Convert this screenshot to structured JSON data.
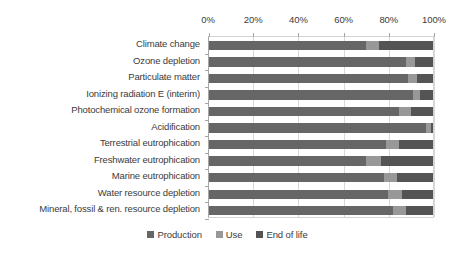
{
  "chart_data": {
    "type": "bar",
    "orientation": "horizontal",
    "stacked": true,
    "normalized_percent": true,
    "title": "",
    "subtitle": "",
    "xlabel": "",
    "ylabel": "",
    "xlim": [
      0,
      100
    ],
    "grid": true,
    "legend_position": "bottom",
    "xticks": [
      0,
      20,
      40,
      60,
      80,
      100
    ],
    "xtick_labels": [
      "0%",
      "20%",
      "40%",
      "60%",
      "80%",
      "100%"
    ],
    "categories": [
      "Climate change",
      "Ozone depletion",
      "Particulate matter",
      "Ionizing radiation E (interim)",
      "Photochemical ozone formation",
      "Acidification",
      "Terrestrial eutrophication",
      "Freshwater eutrophication",
      "Marine eutrophication",
      "Water resource depletion",
      "Mineral, fossil & ren. resource depletion"
    ],
    "series": [
      {
        "name": "Production",
        "color": "#666666",
        "values": [
          70,
          88,
          89,
          91,
          85,
          97,
          79,
          70,
          78,
          80,
          82
        ]
      },
      {
        "name": "Use",
        "color": "#989898",
        "values": [
          6,
          4,
          4,
          3,
          5,
          2,
          6,
          7,
          6,
          6,
          6
        ]
      },
      {
        "name": "End of life",
        "color": "#545454",
        "values": [
          24,
          8,
          7,
          6,
          10,
          1,
          15,
          23,
          16,
          14,
          12
        ]
      }
    ]
  },
  "legend": {
    "items": [
      {
        "label": "Production",
        "color": "#666666",
        "swatch_name": "legend-swatch-production"
      },
      {
        "label": "Use",
        "color": "#989898",
        "swatch_name": "legend-swatch-use"
      },
      {
        "label": "End of life",
        "color": "#545454",
        "swatch_name": "legend-swatch-end-of-life"
      }
    ]
  }
}
